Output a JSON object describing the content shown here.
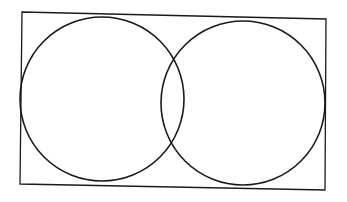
{
  "diagram": {
    "type": "venn-in-rectangle",
    "background": "#ffffff",
    "stroke": "#1a1a1a",
    "rectangle": {
      "points": "22,12 326,19 325,190 20,184"
    },
    "circles": [
      {
        "name": "left",
        "cx": 102,
        "cy": 99,
        "r": 82
      },
      {
        "name": "right",
        "cx": 243,
        "cy": 103,
        "r": 82
      }
    ]
  }
}
